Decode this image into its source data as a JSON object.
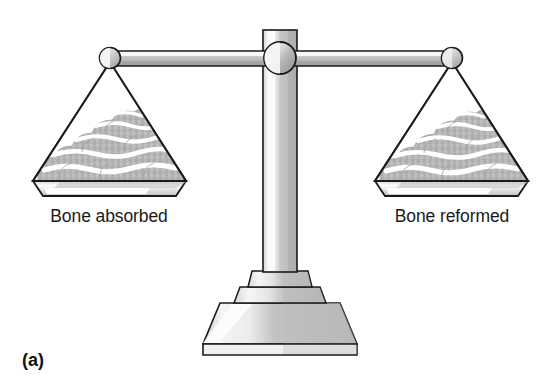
{
  "figure": {
    "panel_letter": "(a)",
    "type": "balance-scale-diagram",
    "left_pan_label": "Bone absorbed",
    "right_pan_label": "Bone reformed",
    "state": "balanced",
    "colors": {
      "outline": "#1a1a1a",
      "metal_light": "#f2f2f2",
      "metal_mid": "#c9c9c9",
      "metal_dark": "#a8a8a8",
      "pile_gray": "#b5b5b5",
      "pile_highlight": "#ffffff",
      "pan_fill": "#ffffff",
      "background": "#ffffff",
      "text": "#1a1a1a"
    },
    "parts": {
      "beam": "horizontal-beam",
      "pivot": "center-pivot-knob",
      "left_knob": "left-end-knob",
      "right_knob": "right-end-knob",
      "column": "vertical-column",
      "base": "stepped-pedestal-base",
      "left_pan": "left-pan",
      "right_pan": "right-pan",
      "left_pile": "left-bone-pile",
      "right_pile": "right-bone-pile"
    }
  }
}
